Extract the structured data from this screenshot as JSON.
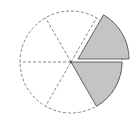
{
  "diagram": {
    "type": "fraction-circle",
    "total_sectors": 6,
    "shaded_sectors": 2,
    "exploded_sectors": 1,
    "colors": {
      "shade": "#c4c4c4",
      "outline": "#555555",
      "dashed": "#777777",
      "background": "#ffffff"
    }
  }
}
